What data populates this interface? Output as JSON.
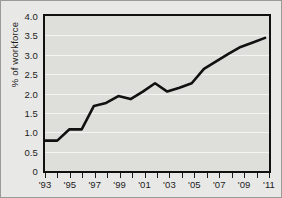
{
  "chart_data": {
    "type": "line",
    "title": "",
    "subtitle": "",
    "xlabel": "",
    "ylabel": "% of workforce",
    "xlim": [
      1993,
      2011
    ],
    "ylim": [
      0,
      4.0
    ],
    "grid": true,
    "legend": "none",
    "line_color": "#111111",
    "plot_background": "#dededb",
    "figure_background": "#e8e8e6",
    "y_ticks": [
      0,
      0.5,
      1.0,
      1.5,
      2.0,
      2.5,
      3.0,
      3.5,
      4.0
    ],
    "y_ticklabels": [
      "0",
      "0.5",
      "1.0",
      "1.5",
      "2.0",
      "2.5",
      "3.0",
      "3.5",
      "4.0"
    ],
    "x_ticks": [
      1993,
      1994,
      1995,
      1996,
      1997,
      1998,
      1999,
      2000,
      2001,
      2002,
      2003,
      2004,
      2005,
      2006,
      2007,
      2008,
      2009,
      2010,
      2011
    ],
    "x_ticklabels": [
      "'93",
      "",
      "'95",
      "",
      "'97",
      "",
      "'99",
      "",
      "'01",
      "",
      "'03",
      "",
      "'05",
      "",
      "'07",
      "",
      "'09",
      "",
      "'11"
    ],
    "x": [
      1993,
      1994,
      1995,
      1996,
      1997,
      1998,
      1999,
      2000,
      2001,
      2002,
      2003,
      2004,
      2005,
      2006,
      2007,
      2008,
      2009,
      2010,
      2011
    ],
    "values": [
      0.7,
      0.7,
      1.0,
      1.0,
      1.62,
      1.7,
      1.88,
      1.8,
      2.0,
      2.22,
      2.0,
      2.1,
      2.22,
      2.6,
      2.8,
      3.0,
      3.18,
      3.3,
      3.42
    ],
    "series": [
      {
        "name": "% of workforce",
        "values": [
          0.7,
          0.7,
          1.0,
          1.0,
          1.62,
          1.7,
          1.88,
          1.8,
          2.0,
          2.22,
          2.0,
          2.1,
          2.22,
          2.6,
          2.8,
          3.0,
          3.18,
          3.3,
          3.42
        ]
      }
    ],
    "annotations": []
  }
}
